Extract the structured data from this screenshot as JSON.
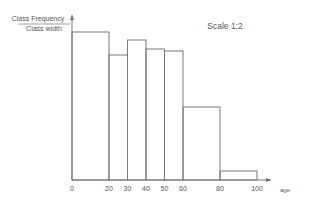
{
  "chart_data": {
    "type": "bar",
    "title": "",
    "annotation": "Scale 1:2",
    "ylabel_numerator": "Class Frequency",
    "ylabel_denominator": "Class width",
    "xlabel": "age",
    "bins": [
      {
        "from": 0,
        "to": 20,
        "height": 14.8
      },
      {
        "from": 20,
        "to": 30,
        "height": 12.5
      },
      {
        "from": 30,
        "to": 40,
        "height": 14.0
      },
      {
        "from": 40,
        "to": 50,
        "height": 13.1
      },
      {
        "from": 50,
        "to": 60,
        "height": 12.9
      },
      {
        "from": 60,
        "to": 80,
        "height": 7.3
      },
      {
        "from": 80,
        "to": 100,
        "height": 0.9
      }
    ],
    "xticks": [
      "0",
      "20",
      "30",
      "40",
      "50",
      "60",
      "80",
      "100"
    ],
    "xlim": [
      0,
      100
    ],
    "ylim": [
      0,
      16
    ],
    "grid": false,
    "legend": null
  },
  "colors": {
    "line": "#777777",
    "text": "#555555"
  }
}
